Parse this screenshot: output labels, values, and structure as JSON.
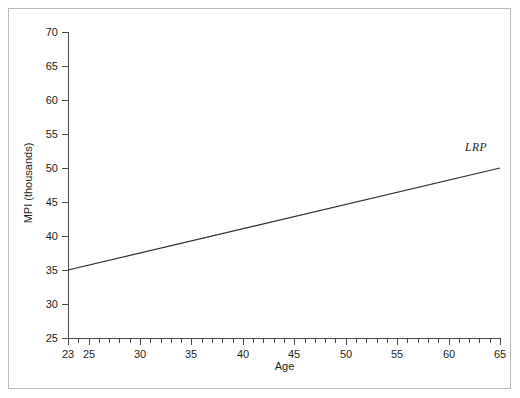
{
  "chart_data": {
    "type": "line",
    "title": "",
    "subtitle": "",
    "xlabel": "Age",
    "ylabel": "MPI (thousands)",
    "xlim": [
      23,
      65
    ],
    "ylim": [
      25,
      70
    ],
    "grid": false,
    "legend_position": "inline-end-of-line",
    "x_ticks_major": [
      23,
      25,
      30,
      35,
      40,
      45,
      50,
      55,
      60,
      65
    ],
    "x_tick_labels": [
      "23",
      "25",
      "30",
      "35",
      "40",
      "45",
      "50",
      "55",
      "60",
      "65"
    ],
    "x_minor_tick_step": 1,
    "y_ticks": [
      25,
      30,
      35,
      40,
      45,
      50,
      55,
      60,
      65,
      70
    ],
    "y_tick_labels": [
      "25",
      "30",
      "35",
      "40",
      "45",
      "50",
      "55",
      "60",
      "65",
      "70"
    ],
    "series": [
      {
        "name": "LRP",
        "annotation": "LRP",
        "color": "#2b2b2b",
        "x": [
          23,
          65
        ],
        "values": [
          35,
          50
        ]
      }
    ]
  },
  "figure": {
    "axis_color": "#4a4a4a",
    "frame_color": "#b9b9b9",
    "text_color": "#231f20",
    "background": "#ffffff"
  }
}
